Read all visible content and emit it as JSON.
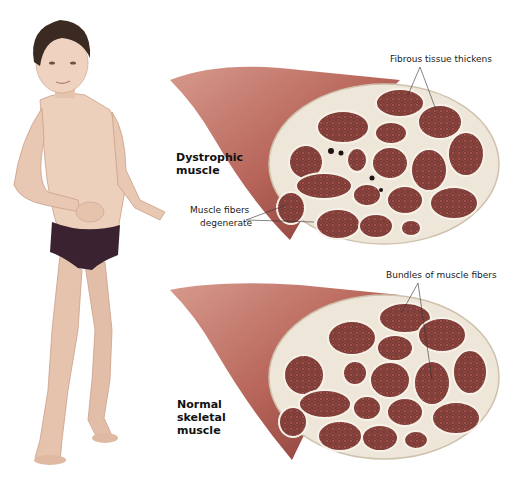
{
  "figure": {
    "colors": {
      "skin": "#e9c9b3",
      "hair": "#3a2a22",
      "briefs": "#3b2230",
      "muscle": "#b8655a",
      "muscle_dark": "#8c3e36",
      "fascicle": "#9a4a44",
      "connective_tissue": "#eee6d8",
      "label_text": "#1a1a1a"
    }
  },
  "panels": [
    {
      "id": "dystrophic",
      "title_line1": "Dystrophic",
      "title_line2": "muscle",
      "callouts": [
        {
          "text": "Fibrous tissue thickens"
        },
        {
          "text_line1": "Muscle fibers",
          "text_line2": "degenerate"
        }
      ]
    },
    {
      "id": "normal",
      "title_line1": "Normal",
      "title_line2": "skeletal",
      "title_line3": "muscle",
      "callouts": [
        {
          "text": "Bundles of muscle fibers"
        }
      ]
    }
  ]
}
